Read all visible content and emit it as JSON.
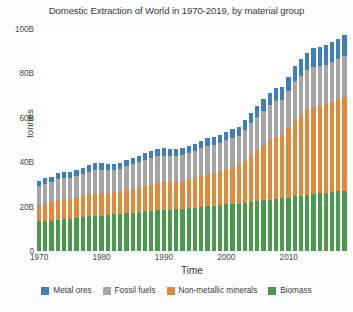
{
  "chart_data": {
    "type": "bar",
    "stacked": true,
    "title": "Domestic Extraction of World in 1970-2019, by material group",
    "xlabel": "Time",
    "ylabel": "tonnes",
    "ylim": [
      0,
      100
    ],
    "yticks": [
      "0",
      "20B",
      "40B",
      "60B",
      "80B",
      "100B"
    ],
    "ytick_values": [
      0,
      20,
      40,
      60,
      80,
      100
    ],
    "xticks": [
      "1970",
      "1980",
      "1990",
      "2000",
      "2010"
    ],
    "xtick_values": [
      1970,
      1980,
      1990,
      2000,
      2010
    ],
    "grid": false,
    "legend_position": "bottom",
    "unit_note": "values in billions of tonnes",
    "categories": [
      1970,
      1971,
      1972,
      1973,
      1974,
      1975,
      1976,
      1977,
      1978,
      1979,
      1980,
      1981,
      1982,
      1983,
      1984,
      1985,
      1986,
      1987,
      1988,
      1989,
      1990,
      1991,
      1992,
      1993,
      1994,
      1995,
      1996,
      1997,
      1998,
      1999,
      2000,
      2001,
      2002,
      2003,
      2004,
      2005,
      2006,
      2007,
      2008,
      2009,
      2010,
      2011,
      2012,
      2013,
      2014,
      2015,
      2016,
      2017,
      2018,
      2019
    ],
    "stack_order_bottom_to_top": [
      "Biomass",
      "Non-metallic minerals",
      "Fossil fuels",
      "Metal ores"
    ],
    "series": [
      {
        "name": "Biomass",
        "color": "#4a9a4e",
        "values": [
          13.3,
          13.6,
          13.7,
          14.1,
          14.5,
          14.6,
          14.8,
          15.2,
          15.6,
          15.8,
          15.9,
          16.1,
          16.5,
          16.6,
          17.1,
          17.3,
          17.7,
          17.9,
          18.2,
          18.4,
          18.6,
          18.7,
          18.8,
          18.9,
          19.2,
          19.6,
          20.0,
          20.2,
          20.4,
          20.7,
          21.0,
          21.2,
          21.4,
          21.7,
          22.2,
          22.5,
          22.8,
          23.1,
          23.6,
          23.8,
          24.1,
          24.6,
          25.0,
          25.4,
          25.8,
          26.0,
          26.3,
          26.6,
          26.9,
          27.2
        ]
      },
      {
        "name": "Non-metallic minerals",
        "color": "#e08b3c",
        "values": [
          7.6,
          8.0,
          8.4,
          8.9,
          9.0,
          8.9,
          9.3,
          9.6,
          10.0,
          10.3,
          10.2,
          10.0,
          9.9,
          10.1,
          10.4,
          10.6,
          11.0,
          11.4,
          11.9,
          12.2,
          12.3,
          12.2,
          12.2,
          12.4,
          12.9,
          13.3,
          13.8,
          14.3,
          14.7,
          15.2,
          15.9,
          16.4,
          17.3,
          19.0,
          21.0,
          22.8,
          24.8,
          26.8,
          27.9,
          28.6,
          31.4,
          34.6,
          36.4,
          38.2,
          39.3,
          39.3,
          39.8,
          40.6,
          41.4,
          42.2
        ]
      },
      {
        "name": "Fossil fuels",
        "color": "#a5a5a5",
        "values": [
          8.2,
          8.6,
          8.9,
          9.4,
          9.4,
          9.3,
          9.7,
          10.0,
          10.2,
          10.6,
          10.5,
          10.3,
          10.3,
          10.4,
          10.8,
          11.1,
          11.3,
          11.6,
          11.9,
          12.1,
          12.1,
          11.9,
          11.8,
          11.8,
          11.9,
          12.1,
          12.4,
          12.6,
          12.6,
          12.7,
          13.0,
          13.2,
          13.3,
          13.8,
          14.4,
          14.9,
          15.3,
          15.7,
          16.1,
          15.8,
          16.5,
          17.2,
          17.5,
          17.8,
          18.0,
          18.0,
          17.9,
          18.1,
          18.4,
          18.6
        ]
      },
      {
        "name": "Metal ores",
        "color": "#3d7ebd",
        "values": [
          2.4,
          2.5,
          2.5,
          2.7,
          2.7,
          2.6,
          2.7,
          2.8,
          2.8,
          2.9,
          2.9,
          2.8,
          2.7,
          2.7,
          2.9,
          3.0,
          3.0,
          3.1,
          3.2,
          3.3,
          3.3,
          3.2,
          3.2,
          3.2,
          3.3,
          3.4,
          3.5,
          3.6,
          3.6,
          3.7,
          3.9,
          4.0,
          4.1,
          4.4,
          4.7,
          5.0,
          5.4,
          5.8,
          6.0,
          5.9,
          6.5,
          7.0,
          7.4,
          7.9,
          8.3,
          8.4,
          8.6,
          8.8,
          9.0,
          9.2
        ]
      }
    ]
  },
  "legend": {
    "items": [
      {
        "label": "Metal ores",
        "color": "#3d7ebd"
      },
      {
        "label": "Fossil fuels",
        "color": "#a5a5a5"
      },
      {
        "label": "Non-metallic minerals",
        "color": "#e08b3c"
      },
      {
        "label": "Biomass",
        "color": "#4a9a4e"
      }
    ]
  }
}
